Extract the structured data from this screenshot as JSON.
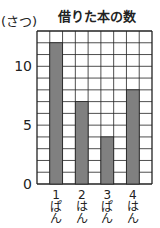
{
  "chart_data": {
    "type": "bar",
    "title": "借りた本の数",
    "ylabel": "(さつ)",
    "xlabel": "",
    "categories": [
      [
        "1",
        "ぱ",
        "ん"
      ],
      [
        "2",
        "は",
        "ん"
      ],
      [
        "3",
        "ぱ",
        "ん"
      ],
      [
        "4",
        "は",
        "ん"
      ]
    ],
    "values": [
      12,
      7,
      4,
      8
    ],
    "ylim": [
      0,
      13
    ],
    "yticks": [
      0,
      5,
      10
    ],
    "grid": true,
    "bar_color": "#808080",
    "grid_color": "#222222"
  }
}
